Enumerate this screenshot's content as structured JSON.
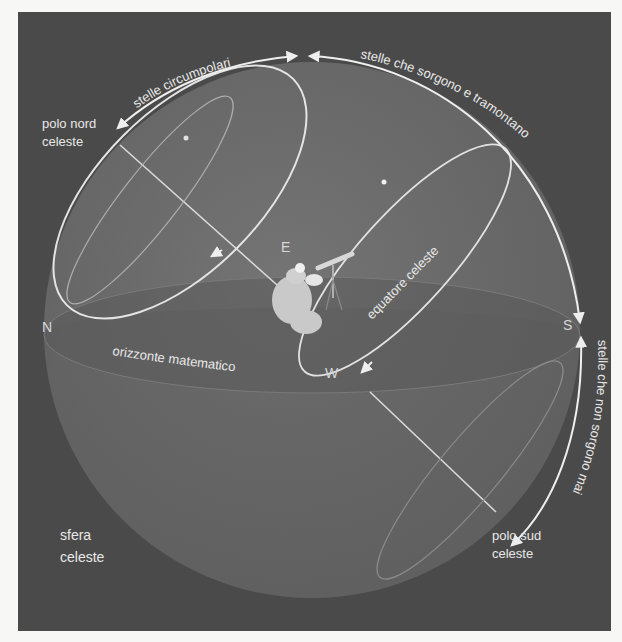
{
  "diagram": {
    "colors": {
      "page_bg": "#f7f7f5",
      "frame_bg": "#4a4a4a",
      "sphere_fill": "#6b6b6b",
      "sphere_below": "#5e5e5e",
      "line": "#e6e6e6",
      "text": "#e8e8e8"
    },
    "labels": {
      "stelle_circumpolari": "stelle circumpolari",
      "stelle_sorgono_tramontano": "stelle che sorgono e tramontano",
      "stelle_non_sorgono": "stelle che non sorgono mai",
      "polo_nord_line1": "polo nord",
      "polo_nord_line2": "celeste",
      "polo_sud_line1": "polo sud",
      "polo_sud_line2": "celeste",
      "equatore": "equatore celeste",
      "orizzonte": "orizzonte matematico",
      "sfera_line1": "sfera",
      "sfera_line2": "celeste"
    },
    "cardinals": {
      "north": "N",
      "south": "S",
      "east": "E",
      "west": "W"
    },
    "icons": {
      "observer": "observer-with-telescope-icon"
    }
  }
}
